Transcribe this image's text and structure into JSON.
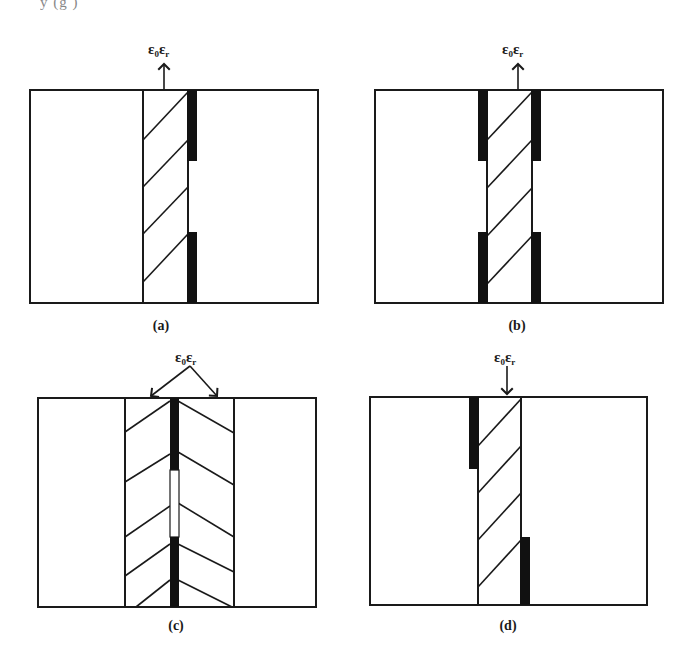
{
  "header_fragment": "y  (g         )",
  "panels": [
    {
      "id": "a",
      "caption": "(a)",
      "annotation": {
        "base": "ε",
        "sub0": "0",
        "base2": "ε",
        "sub1": "r",
        "arrow": "up"
      },
      "electrodes": "one side (right), top and bottom segments"
    },
    {
      "id": "b",
      "caption": "(b)",
      "annotation": {
        "base": "ε",
        "sub0": "0",
        "base2": "ε",
        "sub1": "r",
        "arrow": "up"
      },
      "electrodes": "both sides, top and bottom segments"
    },
    {
      "id": "c",
      "caption": "(c)",
      "annotation": {
        "base": "ε",
        "sub0": "0",
        "base2": "ε",
        "sub1": "r",
        "arrow": "split-down-both"
      },
      "electrodes": "center electrode with gap, two dielectric layers (chevron)"
    },
    {
      "id": "d",
      "caption": "(d)",
      "annotation": {
        "base": "ε",
        "sub0": "0",
        "base2": "ε",
        "sub1": "r",
        "arrow": "down"
      },
      "electrodes": "staggered: left-top and right-bottom"
    }
  ],
  "colors": {
    "line": "#1a1a1a",
    "fill": "#111111",
    "background": "#ffffff"
  }
}
